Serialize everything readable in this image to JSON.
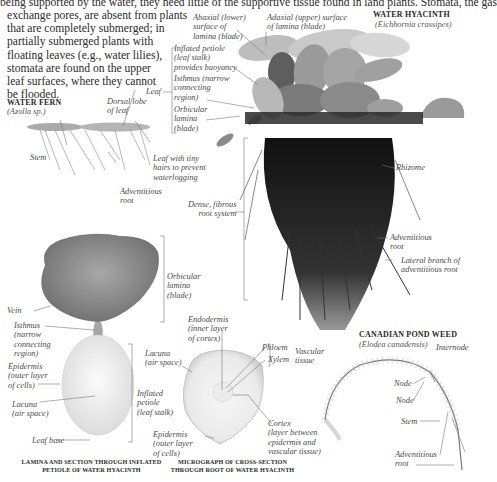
{
  "intro_text": {
    "line0": "being supported by the water, they need little of the supportive tissue found in land plants. Stomata, the gas",
    "lines": [
      "exchange pores, are absent from plants",
      "that are completely submerged; in",
      "partially submerged plants with",
      "floating leaves (e.g., water lilies),",
      "stomata are found on the upper",
      "leaf surfaces, where they cannot",
      "be flooded."
    ]
  },
  "water_hyacinth": {
    "title": "WATER HYACINTH",
    "scientific_name": "(Eichhornia crassipes)",
    "labels": {
      "abaxial": "Abaxial (lower)\nsurface of\nlamina (blade)",
      "adaxial": "Adaxial (upper) surface\nof lamina (blade)",
      "inflated_petiole": "Inflated petiole\n(leaf stalk)\nprovides buoyancy",
      "isthmus": "Isthmus (narrow\nconnecting\nregion)",
      "orbicular": "Orbicular\nlamina\n(blade)",
      "leaf": "Leaf",
      "rhizome": "Rhizome",
      "root_system": "Dense, fibrous\nroot system",
      "adventitious_root": "Adventitious\nroot",
      "lateral_branch": "Lateral branch of\nadventitious root"
    }
  },
  "water_fern": {
    "title": "WATER FERN",
    "scientific_name": "(Azolla sp.)",
    "labels": {
      "dorsal_lobe": "Dorsal lobe\nof leaf",
      "stem": "Stem",
      "leaf_hairs": "Leaf with tiny\nhairs to prevent\nwaterlogging",
      "adventitious_root": "Adventitious\nroot"
    }
  },
  "lamina_section": {
    "labels": {
      "orbicular": "Orbicular\nlamina\n(blade)",
      "vein": "Vein",
      "isthmus": "Isthmus\n(narrow\nconnecting\nregion)",
      "epidermis": "Epidermis\n(outer layer\nof cells)",
      "lacuna": "Lacuna\n(air space)",
      "inflated_petiole": "Inflated\npetiole\n(leaf stalk)",
      "leaf_base": "Leaf base"
    },
    "caption": "LAMINA AND SECTION THROUGH INFLATED\nPETIOLE OF WATER HYACINTH"
  },
  "root_micrograph": {
    "labels": {
      "endodermis": "Endodermis\n(inner layer\nof cortex)",
      "lacuna": "Lacuna\n(air space)",
      "phloem": "Phloem",
      "xylem": "Xylem",
      "vascular_tissue": "Vascular\ntissue",
      "cortex": "Cortex\n(layer between\nepidermis and\nvascular tissue)",
      "epidermis": "Epidermis\n(outer layer\nof cells)"
    },
    "caption": "MICROGRAPH OF CROSS-SECTION\nTHROUGH ROOT OF WATER HYACINTH"
  },
  "pond_weed": {
    "title": "CANADIAN POND WEED",
    "scientific_name": "(Elodea canadensis)",
    "labels": {
      "internode": "Internode",
      "node1": "Node",
      "node2": "Node",
      "stem": "Stem",
      "adventitious_root": "Adventitious\nroot"
    }
  },
  "colors": {
    "text": "#2a2a2a",
    "label": "#4a4a4a",
    "leader": "#777777",
    "plant_dark": "#1a1a1a",
    "plant_mid": "#8a8a8a",
    "plant_light": "#c8c8c8"
  }
}
